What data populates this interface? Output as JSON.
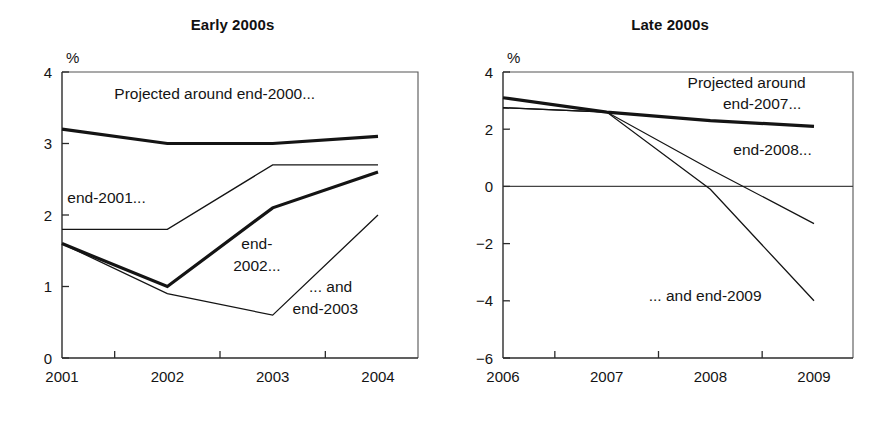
{
  "figure": {
    "panels": [
      "early",
      "late"
    ]
  },
  "chart_data": [
    {
      "id": "early",
      "type": "line",
      "title": "Early 2000s",
      "xlabel": "",
      "ylabel": "%",
      "unit_label": "%",
      "x": [
        2001,
        2002,
        2003,
        2004
      ],
      "categories": [
        "2001",
        "2002",
        "2003",
        "2004"
      ],
      "xtick_labels": [
        "2001",
        "2002",
        "2003",
        "2004"
      ],
      "ytick_labels": [
        "0",
        "1",
        "2",
        "3",
        "4"
      ],
      "yticks": [
        0,
        1,
        2,
        3,
        4
      ],
      "ylim": [
        0,
        4
      ],
      "xlim": [
        2001,
        2004
      ],
      "grid": false,
      "legend": "inline-annotations",
      "series": [
        {
          "name": "Projected around end-2000...",
          "values": [
            3.2,
            3.0,
            3.0,
            3.1
          ],
          "weight": "thick"
        },
        {
          "name": "end-2001...",
          "values": [
            1.8,
            1.8,
            2.7,
            2.7
          ],
          "weight": "thin"
        },
        {
          "name": "end-2002...",
          "values": [
            1.6,
            1.0,
            2.1,
            2.6
          ],
          "weight": "thick"
        },
        {
          "name": "... and end-2003",
          "values": [
            1.6,
            0.9,
            0.6,
            2.0
          ],
          "weight": "thin"
        }
      ],
      "annotations": [
        {
          "text": "Projected around end-2000...",
          "x": 2002.45,
          "y": 3.62,
          "anchor": "middle"
        },
        {
          "text": "end-2001...",
          "x": 2001.05,
          "y": 2.17,
          "anchor": "start"
        },
        {
          "text": "end-",
          "x": 2002.85,
          "y": 1.52,
          "anchor": "middle"
        },
        {
          "text": "2002...",
          "x": 2002.85,
          "y": 1.22,
          "anchor": "middle"
        },
        {
          "text": "... and",
          "x": 2003.55,
          "y": 0.93,
          "anchor": "middle"
        },
        {
          "text": "end-2003",
          "x": 2003.5,
          "y": 0.62,
          "anchor": "middle"
        }
      ]
    },
    {
      "id": "late",
      "type": "line",
      "title": "Late 2000s",
      "xlabel": "",
      "ylabel": "%",
      "unit_label": "%",
      "x": [
        2006,
        2007,
        2008,
        2009
      ],
      "categories": [
        "2006",
        "2007",
        "2008",
        "2009"
      ],
      "xtick_labels": [
        "2006",
        "2007",
        "2008",
        "2009"
      ],
      "ytick_labels": [
        "−6",
        "−4",
        "−2",
        "0",
        "2",
        "4"
      ],
      "yticks": [
        -6,
        -4,
        -2,
        0,
        2,
        4
      ],
      "ylim": [
        -6,
        4
      ],
      "xlim": [
        2006,
        2009
      ],
      "grid": false,
      "zero_line": true,
      "legend": "inline-annotations",
      "series": [
        {
          "name": "Projected around end-2007...",
          "values": [
            3.1,
            2.6,
            2.3,
            2.1
          ],
          "weight": "thick"
        },
        {
          "name": "end-2008...",
          "values": [
            2.75,
            2.6,
            0.6,
            -1.3
          ],
          "weight": "thin"
        },
        {
          "name": "... and end-2009",
          "values": [
            2.75,
            2.6,
            -0.1,
            -4.0
          ],
          "weight": "thin"
        }
      ],
      "annotations": [
        {
          "text": "Projected around",
          "x": 2008.35,
          "y": 3.45,
          "anchor": "middle"
        },
        {
          "text": "end-2007...",
          "x": 2008.5,
          "y": 2.7,
          "anchor": "middle"
        },
        {
          "text": "end-2008...",
          "x": 2008.6,
          "y": 1.1,
          "anchor": "middle"
        },
        {
          "text": "... and end-2009",
          "x": 2007.95,
          "y": -4.0,
          "anchor": "middle"
        }
      ]
    }
  ]
}
